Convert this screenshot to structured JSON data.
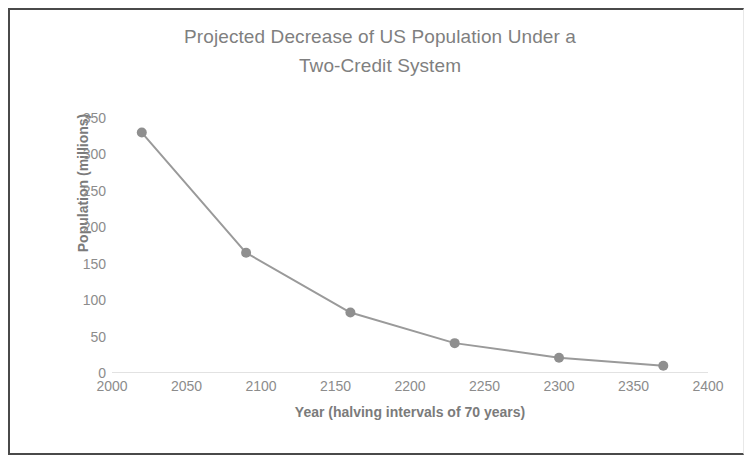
{
  "figure": {
    "border_color": "#4a4a4a",
    "background": "#ffffff"
  },
  "chart_data": {
    "type": "line",
    "title": "Projected Decrease of US Population Under a Two-Credit System",
    "title_line1": "Projected Decrease of US Population Under a",
    "title_line2": "Two-Credit System",
    "xlabel": "Year (halving intervals of 70 years)",
    "ylabel": "Population (millions)",
    "x": [
      2020,
      2090,
      2160,
      2230,
      2300,
      2370
    ],
    "values": [
      330,
      165,
      83,
      41,
      21,
      10
    ],
    "series": [
      {
        "name": "Projected US Population",
        "values": [
          330,
          165,
          83,
          41,
          21,
          10
        ]
      }
    ],
    "xlim": [
      2000,
      2400
    ],
    "ylim": [
      0,
      350
    ],
    "xticks": [
      2000,
      2050,
      2100,
      2150,
      2200,
      2250,
      2300,
      2350,
      2400
    ],
    "yticks": [
      0,
      50,
      100,
      150,
      200,
      250,
      300,
      350
    ],
    "grid": false,
    "legend": null,
    "legend_position": "none",
    "line_color": "#9a9a9a",
    "marker_color": "#8f8f8f",
    "marker_shape": "circle",
    "title_color": "#7f7f7f",
    "tick_color": "#8c8c8c",
    "axis_label_color": "#7b7b7b"
  }
}
